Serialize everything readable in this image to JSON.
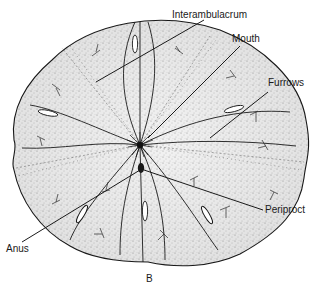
{
  "figure": {
    "panel_letter": "B",
    "labels": {
      "interambulacrum": "Interambulacrum",
      "mouth": "Mouth",
      "furrows": "Furrows",
      "periproct": "Periproct",
      "anus": "Anus"
    },
    "colors": {
      "ink": "#1a1a1a",
      "stipple": "#8a8a8a",
      "background": "#ffffff"
    }
  }
}
